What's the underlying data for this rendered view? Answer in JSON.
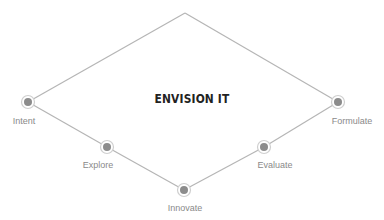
{
  "title": "ENVISION IT",
  "colors": {
    "line": "#b5b5b5",
    "ring": "#cfcfcf",
    "dot": "#8c8c8c",
    "label": "#8a8a8a",
    "title": "#222222"
  },
  "apex": {
    "x": 185,
    "y": 13
  },
  "nodes": [
    {
      "id": "intent",
      "label": "Intent",
      "x": 28,
      "y": 102
    },
    {
      "id": "explore",
      "label": "Explore",
      "x": 107,
      "y": 147
    },
    {
      "id": "innovate",
      "label": "Innovate",
      "x": 184,
      "y": 190
    },
    {
      "id": "evaluate",
      "label": "Evaluate",
      "x": 264,
      "y": 147
    },
    {
      "id": "formulate",
      "label": "Formulate",
      "x": 338,
      "y": 102
    }
  ]
}
